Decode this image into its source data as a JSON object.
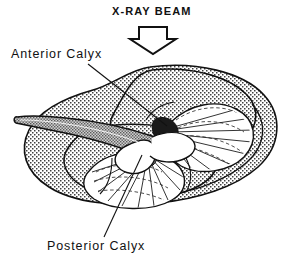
{
  "figure": {
    "type": "anatomical-line-drawing",
    "beam": {
      "label": "X-RAY BEAM",
      "arrow_icon": "down-arrow-outline-icon",
      "direction": "down"
    },
    "labels": {
      "anterior": "Anterior Calyx",
      "posterior": "Posterior Calyx"
    },
    "colors": {
      "ink": "#111111",
      "paper": "#ffffff",
      "stipple": "#4a4a4a",
      "pelvis_fill": "#9a9a9a",
      "calyx_fill": "#ffffff",
      "neck_shadow": "#1a1a1a"
    }
  }
}
